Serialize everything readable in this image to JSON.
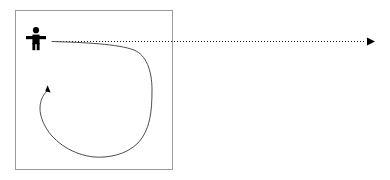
{
  "canvas": {
    "width": 390,
    "height": 180,
    "background": "#ffffff",
    "title": "Agent trajectory diagram"
  },
  "colors": {
    "stroke_dark": "#1a1a1a",
    "stroke_curve": "#4d4d4d",
    "box_border": "#999999",
    "figure_fill": "#000000",
    "background": "#ffffff"
  },
  "boundary_box": {
    "label": "enclosure-boundary",
    "x": 15,
    "y": 10,
    "width": 158,
    "height": 160,
    "stroke": "#999999",
    "stroke_width": 1,
    "fill": "none"
  },
  "figure": {
    "label": "person-pictogram",
    "center_x": 36,
    "top_y": 27,
    "bottom_y": 50,
    "head_radius": 3.1,
    "arm_span": 20,
    "fill": "#000000"
  },
  "dotted_path": {
    "label": "intended-straight-path",
    "style": "dotted",
    "start_x": 57,
    "start_y": 41,
    "end_x": 366,
    "end_y": 41,
    "stroke": "#1a1a1a",
    "stroke_width": 1,
    "dash_array": "1 2",
    "arrowhead": {
      "label": "right-pointing-triangle",
      "tip_x": 375,
      "tip_y": 41,
      "width": 8,
      "height": 8
    }
  },
  "curved_path": {
    "label": "actual-looping-trajectory",
    "style": "solid",
    "stroke": "#4d4d4d",
    "stroke_width": 1,
    "start_x": 52,
    "start_y": 41,
    "rightmost_x": 152,
    "rightmost_y": 100,
    "bottom_x": 95,
    "bottom_y": 157,
    "leftmost_x": 40,
    "leftmost_y": 112,
    "end_x": 48,
    "end_y": 90,
    "d": "M 52,41.5 C 85,42.5 118,44 134,50 C 146,55 152,70 152,90 C 152,112 150,130 138,143 C 126,155 108,158 94,157 C 74,155 54,143 45,126 C 38,113 38,100 47,91",
    "arrowhead": {
      "label": "up-pointing-triangle",
      "tip_x": 48,
      "tip_y": 85,
      "width": 5,
      "height": 7,
      "rotation_deg": -18
    }
  }
}
